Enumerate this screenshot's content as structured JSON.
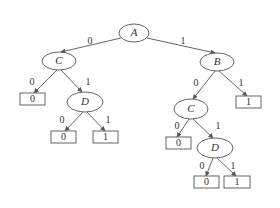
{
  "diagram": {
    "type": "binary decision tree",
    "colors": {
      "stroke": "#555555",
      "text": "#333333",
      "background": "#ffffff"
    },
    "nodes": [
      {
        "id": "A",
        "label": "A",
        "kind": "decision",
        "cx": 134,
        "cy": 33,
        "rx": 15,
        "ry": 9
      },
      {
        "id": "C1",
        "label": "C",
        "kind": "decision",
        "cx": 59,
        "cy": 61,
        "rx": 17,
        "ry": 9
      },
      {
        "id": "B",
        "label": "B",
        "kind": "decision",
        "cx": 217,
        "cy": 62,
        "rx": 17,
        "ry": 9
      },
      {
        "id": "L1",
        "label": "0",
        "kind": "leaf",
        "x": 20,
        "y": 93,
        "w": 25,
        "h": 12
      },
      {
        "id": "D1",
        "label": "D",
        "kind": "decision",
        "cx": 85,
        "cy": 102,
        "rx": 18,
        "ry": 10
      },
      {
        "id": "L2",
        "label": "1",
        "kind": "leaf",
        "x": 236,
        "y": 96,
        "w": 25,
        "h": 12
      },
      {
        "id": "C2",
        "label": "C",
        "kind": "decision",
        "cx": 191,
        "cy": 109,
        "rx": 17,
        "ry": 10
      },
      {
        "id": "L3",
        "label": "0",
        "kind": "leaf",
        "x": 51,
        "y": 131,
        "w": 25,
        "h": 12
      },
      {
        "id": "L4",
        "label": "1",
        "kind": "leaf",
        "x": 93,
        "y": 131,
        "w": 25,
        "h": 12
      },
      {
        "id": "L5",
        "label": "0",
        "kind": "leaf",
        "x": 166,
        "y": 137,
        "w": 25,
        "h": 12
      },
      {
        "id": "D2",
        "label": "D",
        "kind": "decision",
        "cx": 215,
        "cy": 148,
        "rx": 18,
        "ry": 10
      },
      {
        "id": "L6",
        "label": "0",
        "kind": "leaf",
        "x": 194,
        "y": 176,
        "w": 25,
        "h": 12
      },
      {
        "id": "L7",
        "label": "1",
        "kind": "leaf",
        "x": 224,
        "y": 176,
        "w": 26,
        "h": 12
      }
    ],
    "edges": [
      {
        "from": "A",
        "to": "C1",
        "label": "0",
        "x1": 121,
        "y1": 38,
        "x2": 61,
        "y2": 52,
        "lx": 90,
        "ly": 42
      },
      {
        "from": "A",
        "to": "B",
        "label": "1",
        "x1": 147,
        "y1": 38,
        "x2": 215,
        "y2": 53,
        "lx": 183,
        "ly": 42
      },
      {
        "from": "C1",
        "to": "L1",
        "label": "0",
        "x1": 57,
        "y1": 70,
        "x2": 34,
        "y2": 93,
        "lx": 32,
        "ly": 83
      },
      {
        "from": "C1",
        "to": "D1",
        "label": "1",
        "x1": 61,
        "y1": 70,
        "x2": 82,
        "y2": 92,
        "lx": 88,
        "ly": 83
      },
      {
        "from": "B",
        "to": "C2",
        "label": "0",
        "x1": 215,
        "y1": 71,
        "x2": 193,
        "y2": 99,
        "lx": 196,
        "ly": 84
      },
      {
        "from": "B",
        "to": "L2",
        "label": "1",
        "x1": 219,
        "y1": 71,
        "x2": 247,
        "y2": 96,
        "lx": 241,
        "ly": 84
      },
      {
        "from": "D1",
        "to": "L3",
        "label": "0",
        "x1": 83,
        "y1": 112,
        "x2": 65,
        "y2": 131,
        "lx": 62,
        "ly": 121
      },
      {
        "from": "D1",
        "to": "L4",
        "label": "1",
        "x1": 87,
        "y1": 112,
        "x2": 105,
        "y2": 131,
        "lx": 108,
        "ly": 121
      },
      {
        "from": "C2",
        "to": "L5",
        "label": "0",
        "x1": 189,
        "y1": 119,
        "x2": 177,
        "y2": 137,
        "lx": 177,
        "ly": 127
      },
      {
        "from": "C2",
        "to": "D2",
        "label": "1",
        "x1": 193,
        "y1": 119,
        "x2": 213,
        "y2": 138,
        "lx": 218,
        "ly": 127
      },
      {
        "from": "D2",
        "to": "L6",
        "label": "0",
        "x1": 213,
        "y1": 158,
        "x2": 206,
        "y2": 176,
        "lx": 202,
        "ly": 167
      },
      {
        "from": "D2",
        "to": "L7",
        "label": "1",
        "x1": 217,
        "y1": 158,
        "x2": 236,
        "y2": 176,
        "lx": 233,
        "ly": 167
      }
    ]
  }
}
